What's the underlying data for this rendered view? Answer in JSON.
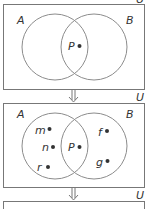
{
  "diagram": {
    "title": "",
    "colors": {
      "stroke": "#8c8c8c",
      "box_stroke": "#777777",
      "text": "#333333",
      "dot": "#333333",
      "background": "#ffffff"
    },
    "panels": [
      {
        "universe_label": "U",
        "set_a_label": "A",
        "set_b_label": "B",
        "intersection_elements": [
          "P"
        ],
        "a_only_elements": [],
        "b_only_elements": []
      },
      {
        "universe_label": "U",
        "set_a_label": "A",
        "set_b_label": "B",
        "intersection_elements": [
          "P"
        ],
        "a_only_elements": [
          "m",
          "n",
          "r"
        ],
        "b_only_elements": [
          "f",
          "g"
        ]
      },
      {
        "universe_label": "U",
        "set_a_label": "",
        "set_b_label": "",
        "intersection_elements": [],
        "a_only_elements": [],
        "b_only_elements": []
      }
    ],
    "arrows": [
      "down-arrow",
      "down-arrow"
    ]
  }
}
